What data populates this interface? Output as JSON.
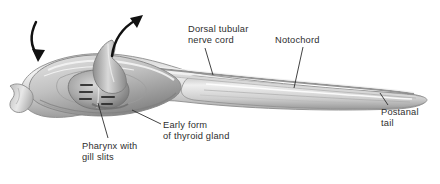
{
  "figure": {
    "background_color": "#ffffff",
    "text_color": "#2e2e2e",
    "body_gray_light": "#e9e9e9",
    "body_gray_mid": "#b9b9b9",
    "body_gray_dark": "#7c7c7c",
    "outline_color": "#8a8a8a"
  },
  "labels": {
    "nerve_cord": "Dorsal tubular\nnerve cord",
    "notochord": "Notochord",
    "postanal_tail": "Postanal\ntail",
    "pharynx": "Pharynx with\ngill slits",
    "thyroid": "Early form\nof thyroid gland"
  },
  "arrows": [
    {
      "name": "incurrent-water-arrow",
      "direction": "down-right",
      "description": "water entering mouth"
    },
    {
      "name": "excurrent-water-arrow",
      "direction": "up-right",
      "description": "water exiting atrial siphon"
    }
  ],
  "anatomy": [
    {
      "name": "oral-hood",
      "label": null
    },
    {
      "name": "pharynx-gill-slits",
      "label": "Pharynx with gill slits"
    },
    {
      "name": "endostyle-thyroid",
      "label": "Early form of thyroid gland"
    },
    {
      "name": "dorsal-nerve-cord",
      "label": "Dorsal tubular nerve cord"
    },
    {
      "name": "notochord",
      "label": "Notochord"
    },
    {
      "name": "postanal-tail",
      "label": "Postanal tail"
    },
    {
      "name": "atrial-siphon",
      "label": null
    }
  ]
}
